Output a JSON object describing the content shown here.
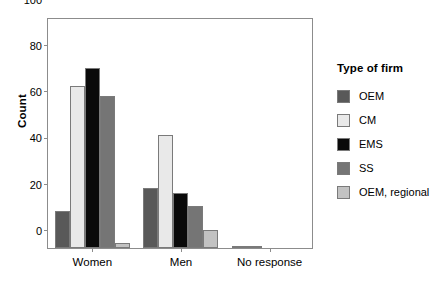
{
  "chart_data": {
    "type": "bar",
    "title": "",
    "xlabel": "",
    "ylabel": "Count",
    "ylim": [
      0,
      100
    ],
    "yticks": [
      0,
      20,
      40,
      60,
      80,
      100
    ],
    "grid": false,
    "legend_position": "right",
    "legend_title": "Type of firm",
    "categories": [
      "Women",
      "Men",
      "No response"
    ],
    "series": [
      {
        "name": "OEM",
        "color": "#595959",
        "values": [
          16,
          26,
          1
        ]
      },
      {
        "name": "CM",
        "color": "#e9e9e9",
        "values": [
          70,
          49,
          1
        ]
      },
      {
        "name": "EMS",
        "color": "#0a0a0a",
        "values": [
          78,
          24,
          0
        ]
      },
      {
        "name": "SS",
        "color": "#757575",
        "values": [
          66,
          18,
          0
        ]
      },
      {
        "name": "OEM, regional",
        "color": "#c2c2c2",
        "values": [
          2,
          8,
          0
        ]
      }
    ]
  }
}
